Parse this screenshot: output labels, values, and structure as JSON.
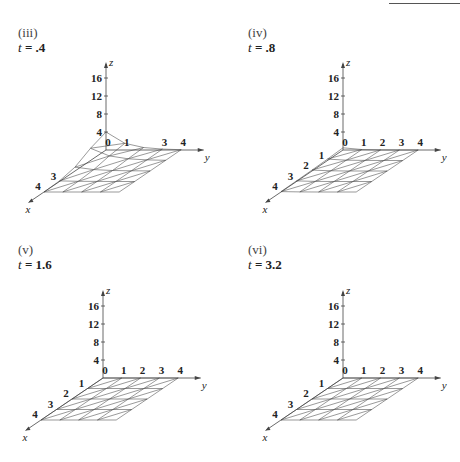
{
  "chart_data": [
    {
      "id": "iii",
      "label": "(iii)",
      "t_label": "t = .4",
      "t": 0.4,
      "type": "surface-3d-wireframe",
      "axes": {
        "x_label": "x",
        "y_label": "y",
        "z_label": "z",
        "z_ticks": [
          "4",
          "8",
          "12",
          "16"
        ],
        "x_ticks": [
          "3",
          "4"
        ],
        "y_ticks": [
          "0",
          "1",
          "3",
          "4"
        ],
        "x_range": [
          0,
          4
        ],
        "y_range": [
          0,
          4
        ],
        "z_range": [
          0,
          18
        ]
      },
      "description": "Peaked surface near origin, max z ≈ 4 at origin corner, decaying toward edges",
      "peak_z": 4
    },
    {
      "id": "iv",
      "label": "(iv)",
      "t_label": "t = .8",
      "t": 0.8,
      "type": "surface-3d-wireframe",
      "axes": {
        "x_label": "x",
        "y_label": "y",
        "z_label": "z",
        "z_ticks": [
          "4",
          "8",
          "12",
          "16"
        ],
        "x_ticks": [
          "1",
          "2",
          "3",
          "4"
        ],
        "y_ticks": [
          "0",
          "1",
          "2",
          "3",
          "4"
        ],
        "x_range": [
          0,
          4
        ],
        "y_range": [
          0,
          4
        ],
        "z_range": [
          0,
          18
        ]
      },
      "description": "Nearly flat surface with slight bump near origin",
      "peak_z": 0.5
    },
    {
      "id": "v",
      "label": "(v)",
      "t_label": "t = 1.6",
      "t": 1.6,
      "type": "surface-3d-wireframe",
      "axes": {
        "x_label": "x",
        "y_label": "y",
        "z_label": "z",
        "z_ticks": [
          "4",
          "8",
          "12",
          "16"
        ],
        "x_ticks": [
          "1",
          "2",
          "3",
          "4"
        ],
        "y_ticks": [
          "0",
          "1",
          "2",
          "3",
          "4"
        ],
        "x_range": [
          0,
          4
        ],
        "y_range": [
          0,
          4
        ],
        "z_range": [
          0,
          18
        ]
      },
      "description": "Flat surface (z ≈ 0) triangulated grid",
      "peak_z": 0
    },
    {
      "id": "vi",
      "label": "(vi)",
      "t_label": "t = 3.2",
      "t": 3.2,
      "type": "surface-3d-wireframe",
      "axes": {
        "x_label": "x",
        "y_label": "y",
        "z_label": "z",
        "z_ticks": [
          "4",
          "8",
          "12",
          "16"
        ],
        "x_ticks": [
          "1",
          "2",
          "3",
          "4"
        ],
        "y_ticks": [
          "0",
          "1",
          "2",
          "3",
          "4"
        ],
        "x_range": [
          0,
          4
        ],
        "y_range": [
          0,
          4
        ],
        "z_range": [
          0,
          18
        ]
      },
      "description": "Flat surface (z ≈ 0) triangulated grid",
      "peak_z": 0
    }
  ],
  "panels": [
    {
      "roman": "(iii)",
      "t_var": "t",
      "t_rest": " = .4"
    },
    {
      "roman": "(iv)",
      "t_var": "t",
      "t_rest": " = .8"
    },
    {
      "roman": "(v)",
      "t_var": "t",
      "t_rest": " = 1.6"
    },
    {
      "roman": "(vi)",
      "t_var": "t",
      "t_rest": " = 3.2"
    }
  ]
}
